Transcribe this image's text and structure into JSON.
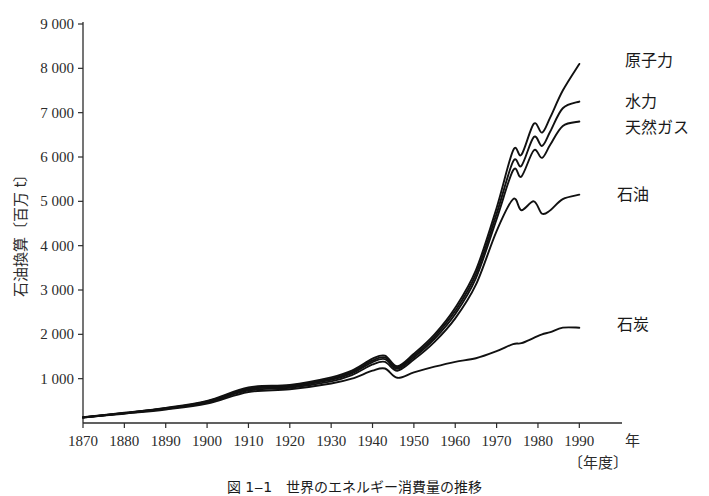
{
  "chart_data": {
    "type": "line",
    "title": "",
    "xlabel": "年",
    "xlabel_sub": "〔年度〕",
    "ylabel": "石油換算〔百万 t〕",
    "xlim": [
      1870,
      1995
    ],
    "ylim": [
      0,
      9000
    ],
    "grid": false,
    "legend_position": "line-end-labels",
    "x_ticks": [
      1870,
      1880,
      1890,
      1900,
      1910,
      1920,
      1930,
      1940,
      1950,
      1960,
      1970,
      1980,
      1990
    ],
    "x_tick_labels": [
      "1870",
      "1880",
      "1890",
      "1900",
      "1910",
      "1920",
      "1930",
      "1940",
      "1950",
      "1960",
      "1970",
      "1980",
      "1990"
    ],
    "y_ticks": [
      1000,
      2000,
      3000,
      4000,
      5000,
      6000,
      7000,
      8000,
      9000
    ],
    "y_tick_labels": [
      "1 000",
      "2 000",
      "3 000",
      "4 000",
      "5 000",
      "6 000",
      "7 000",
      "8 000",
      "9 000"
    ],
    "x": [
      1870,
      1880,
      1890,
      1900,
      1910,
      1920,
      1930,
      1935,
      1940,
      1943,
      1946,
      1950,
      1955,
      1960,
      1965,
      1970,
      1974,
      1976,
      1979,
      1981,
      1983,
      1986,
      1990
    ],
    "series": [
      {
        "name": "原子力",
        "label": "原子力",
        "values": [
          130,
          230,
          340,
          500,
          800,
          860,
          1030,
          1180,
          1450,
          1520,
          1280,
          1560,
          2000,
          2600,
          3450,
          4850,
          6150,
          6050,
          6750,
          6550,
          6900,
          7500,
          8100
        ]
      },
      {
        "name": "水力",
        "label": "水力",
        "values": [
          128,
          226,
          333,
          488,
          780,
          840,
          1000,
          1150,
          1410,
          1480,
          1250,
          1520,
          1950,
          2530,
          3360,
          4720,
          5900,
          5800,
          6450,
          6250,
          6580,
          7100,
          7250
        ]
      },
      {
        "name": "天然ガス",
        "label": "天然ガス",
        "values": [
          126,
          222,
          326,
          476,
          760,
          820,
          975,
          1120,
          1375,
          1440,
          1220,
          1480,
          1900,
          2460,
          3270,
          4600,
          5700,
          5560,
          6150,
          5980,
          6280,
          6700,
          6800
        ]
      },
      {
        "name": "石油",
        "label": "石油",
        "values": [
          125,
          218,
          318,
          462,
          735,
          795,
          940,
          1080,
          1320,
          1380,
          1180,
          1430,
          1830,
          2360,
          3120,
          4330,
          5050,
          4800,
          5000,
          4720,
          4800,
          5050,
          5150
        ]
      },
      {
        "name": "石炭",
        "label": "石炭",
        "values": [
          122,
          210,
          305,
          440,
          700,
          760,
          890,
          1000,
          1180,
          1230,
          1020,
          1140,
          1270,
          1380,
          1460,
          1620,
          1780,
          1800,
          1920,
          2000,
          2050,
          2150,
          2150
        ]
      }
    ],
    "caption": "図 1‒1　世界のエネルギー消費量の推移"
  }
}
